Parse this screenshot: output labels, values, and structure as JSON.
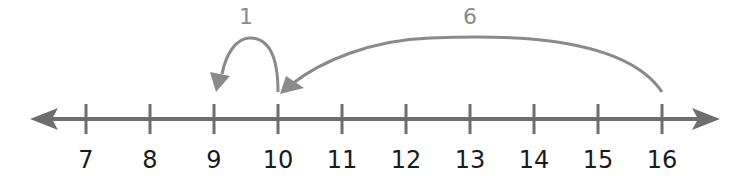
{
  "number_line": {
    "min": 7,
    "max": 16,
    "ticks": [
      "7",
      "8",
      "9",
      "10",
      "11",
      "12",
      "13",
      "14",
      "15",
      "16"
    ],
    "line_color": "#6e6e6e",
    "label_color": "#1a1a1a"
  },
  "jumps": [
    {
      "label": "6",
      "from": 16,
      "to": 10,
      "direction": "left"
    },
    {
      "label": "1",
      "from": 10,
      "to": 9,
      "direction": "left"
    }
  ],
  "jump_color": "#8a8a8a"
}
